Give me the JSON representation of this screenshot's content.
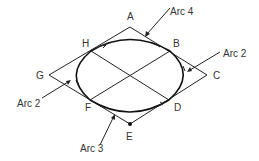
{
  "diagram": {
    "title": "",
    "points": {
      "A": {
        "label": "A",
        "x": 130,
        "y": 27
      },
      "B": {
        "label": "B",
        "x": 170,
        "y": 51
      },
      "C": {
        "label": "C",
        "x": 207,
        "y": 75
      },
      "D": {
        "label": "D",
        "x": 169,
        "y": 100
      },
      "E": {
        "label": "E",
        "x": 130,
        "y": 124
      },
      "F": {
        "label": "F",
        "x": 90,
        "y": 100
      },
      "G": {
        "label": "G",
        "x": 49,
        "y": 75
      },
      "H": {
        "label": "H",
        "x": 91,
        "y": 51
      }
    },
    "callouts": [
      {
        "label": "Arc 4",
        "target": "top arc"
      },
      {
        "label": "Arc 2",
        "target": "right arc"
      },
      {
        "label": "Arc 2",
        "target": "left arc"
      },
      {
        "label": "Arc 3",
        "target": "bottom arc"
      }
    ],
    "colors": {
      "stroke": "#222222",
      "text": "#333333"
    }
  }
}
